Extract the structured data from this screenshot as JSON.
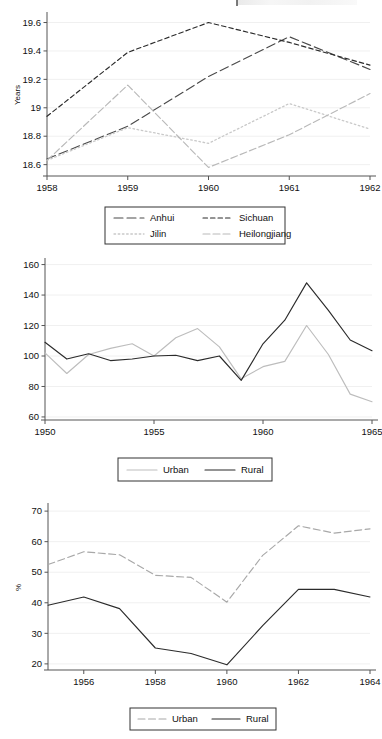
{
  "page": {
    "background": "#ffffff",
    "ink": "#111111"
  },
  "colors": {
    "dark_line": "#2b2b2b",
    "mid_line": "#6f6f6f",
    "light_line": "#b9b9b9",
    "lighter_line": "#d2d2d2",
    "grid": "#f0f0f0",
    "axis": "#555555",
    "legend_border": "#333333"
  },
  "chart_data": [
    {
      "id": "chart-1-provincial-years",
      "type": "line",
      "title": "",
      "xlabel": "",
      "ylabel": "Years",
      "xlim": [
        1958,
        1962
      ],
      "ylim": [
        18.52,
        19.66
      ],
      "xticks": [
        1958,
        1959,
        1960,
        1961,
        1962
      ],
      "xticklabels": [
        "1958",
        "1959",
        "1960",
        "1961",
        "1962"
      ],
      "yticks": [
        18.6,
        18.8,
        19.0,
        19.2,
        19.4,
        19.6
      ],
      "yticklabels": [
        "18.6",
        "18.8",
        "19",
        "19.2",
        "19.4",
        "19.6"
      ],
      "grid": true,
      "legend_position": "below",
      "x": [
        1958,
        1959,
        1960,
        1961,
        1962
      ],
      "series": [
        {
          "name": "Anhui",
          "style": "long-dash",
          "color": "#4a4a4a",
          "values": [
            18.64,
            18.87,
            19.22,
            19.5,
            19.27
          ]
        },
        {
          "name": "Sichuan",
          "style": "short-dash",
          "color": "#2b2b2b",
          "values": [
            18.94,
            19.39,
            19.6,
            19.46,
            19.3
          ]
        },
        {
          "name": "Jilin",
          "style": "dotted",
          "color": "#c9c9c9",
          "values": [
            18.63,
            18.86,
            18.75,
            19.03,
            18.85
          ]
        },
        {
          "name": "Heilongjiang",
          "style": "dash-dot",
          "color": "#b9b9b9",
          "values": [
            18.63,
            19.16,
            18.58,
            18.81,
            19.1
          ]
        }
      ]
    },
    {
      "id": "chart-2-urban-rural-index",
      "type": "line",
      "title": "",
      "xlabel": "",
      "ylabel": "",
      "xlim": [
        1950,
        1965
      ],
      "ylim": [
        58,
        163
      ],
      "xticks": [
        1950,
        1955,
        1960,
        1965
      ],
      "xticklabels": [
        "1950",
        "1955",
        "1960",
        "1965"
      ],
      "yticks": [
        60,
        80,
        100,
        120,
        140,
        160
      ],
      "yticklabels": [
        "60",
        "80",
        "100",
        "120",
        "140",
        "160"
      ],
      "grid": true,
      "legend_position": "below",
      "x": [
        1950,
        1951,
        1952,
        1953,
        1954,
        1955,
        1956,
        1957,
        1958,
        1959,
        1960,
        1961,
        1962,
        1963,
        1964,
        1965
      ],
      "series": [
        {
          "name": "Urban",
          "style": "solid",
          "color": "#bdbdbd",
          "values": [
            102,
            88.5,
            101,
            105,
            108,
            100,
            112,
            118,
            106,
            85,
            93,
            96.5,
            120,
            101,
            75,
            70
          ]
        },
        {
          "name": "Rural",
          "style": "solid",
          "color": "#2b2b2b",
          "values": [
            109,
            98,
            101.5,
            97,
            98,
            100,
            100.5,
            97,
            100,
            84,
            108,
            123.5,
            148,
            130,
            110.5,
            103.5
          ]
        }
      ]
    },
    {
      "id": "chart-3-urban-rural-percent",
      "type": "line",
      "title": "",
      "xlabel": "",
      "ylabel": "%",
      "xlim": [
        1955,
        1964
      ],
      "ylim": [
        18,
        72
      ],
      "xticks": [
        1956,
        1958,
        1960,
        1962,
        1964
      ],
      "xticklabels": [
        "1956",
        "1958",
        "1960",
        "1962",
        "1964"
      ],
      "yticks": [
        20,
        30,
        40,
        50,
        60,
        70
      ],
      "yticklabels": [
        "20",
        "30",
        "40",
        "50",
        "60",
        "70"
      ],
      "grid": true,
      "legend_position": "below",
      "x": [
        1955,
        1956,
        1957,
        1958,
        1959,
        1960,
        1961,
        1962,
        1963,
        1964
      ],
      "series": [
        {
          "name": "Urban",
          "style": "dashed",
          "color": "#a8a8a8",
          "values": [
            52.5,
            56.7,
            55.7,
            49,
            48.3,
            40.2,
            55.5,
            65.2,
            62.8,
            64.2
          ]
        },
        {
          "name": "Rural",
          "style": "solid",
          "color": "#2b2b2b",
          "values": [
            39.2,
            41.9,
            38.1,
            25.2,
            23.4,
            19.7,
            32.5,
            44.4,
            44.4,
            41.9
          ]
        }
      ]
    }
  ],
  "legends": {
    "chart1": [
      {
        "label": "Anhui",
        "style": "long-dash",
        "color": "#4a4a4a"
      },
      {
        "label": "Sichuan",
        "style": "short-dash",
        "color": "#2b2b2b"
      },
      {
        "label": "Jilin",
        "style": "dotted",
        "color": "#c9c9c9"
      },
      {
        "label": "Heilongjiang",
        "style": "dash-dot",
        "color": "#b9b9b9"
      }
    ],
    "chart2": [
      {
        "label": "Urban",
        "style": "solid",
        "color": "#bdbdbd"
      },
      {
        "label": "Rural",
        "style": "solid",
        "color": "#2b2b2b"
      }
    ],
    "chart3": [
      {
        "label": "Urban",
        "style": "dashed",
        "color": "#a8a8a8"
      },
      {
        "label": "Rural",
        "style": "solid",
        "color": "#2b2b2b"
      }
    ]
  }
}
